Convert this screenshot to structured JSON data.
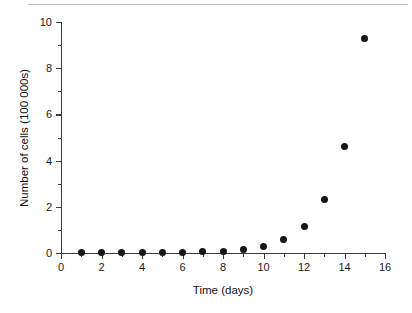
{
  "chart_data": {
    "type": "scatter",
    "title": "",
    "xlabel": "Time (days)",
    "ylabel": "Number of cells (100 000s)",
    "xlim": [
      0,
      16
    ],
    "ylim": [
      0,
      10
    ],
    "grid": false,
    "legend": null,
    "x_ticks": [
      0,
      2,
      4,
      6,
      8,
      10,
      12,
      14,
      16
    ],
    "x_tick_labels": [
      "0",
      "2",
      "4",
      "6",
      "8",
      "10",
      "12",
      "14",
      "16"
    ],
    "x_minor_ticks": [
      1,
      3,
      5,
      7,
      9,
      11,
      13,
      15
    ],
    "y_ticks": [
      0,
      2,
      4,
      6,
      8,
      10
    ],
    "y_tick_labels": [
      "0",
      "2",
      "4",
      "6",
      "8",
      "10"
    ],
    "y_minor_ticks": [
      1,
      3,
      5,
      7,
      9
    ],
    "marker": "filled-circle",
    "marker_color": "#161616",
    "axis_color": "#3a3a3a",
    "x": [
      1,
      2,
      3,
      4,
      5,
      6,
      7,
      8,
      9,
      10,
      11,
      12,
      13,
      14,
      15
    ],
    "values": [
      0.02,
      0.02,
      0.02,
      0.03,
      0.03,
      0.04,
      0.05,
      0.07,
      0.15,
      0.3,
      0.6,
      1.15,
      2.3,
      4.6,
      9.3
    ],
    "points": [
      {
        "x": 1,
        "y": 0.02
      },
      {
        "x": 2,
        "y": 0.02
      },
      {
        "x": 3,
        "y": 0.02
      },
      {
        "x": 4,
        "y": 0.03
      },
      {
        "x": 5,
        "y": 0.03
      },
      {
        "x": 6,
        "y": 0.04
      },
      {
        "x": 7,
        "y": 0.05
      },
      {
        "x": 8,
        "y": 0.07
      },
      {
        "x": 9,
        "y": 0.15
      },
      {
        "x": 10,
        "y": 0.3
      },
      {
        "x": 11,
        "y": 0.6
      },
      {
        "x": 12,
        "y": 1.15
      },
      {
        "x": 13,
        "y": 2.3
      },
      {
        "x": 14,
        "y": 4.6
      },
      {
        "x": 15,
        "y": 9.3
      }
    ]
  },
  "figure": {
    "background_color": "#ffffff",
    "text_color": "#1a1a1a"
  }
}
